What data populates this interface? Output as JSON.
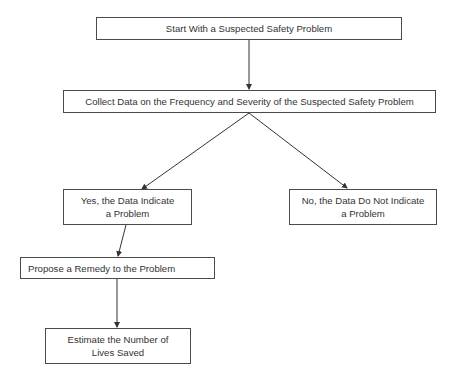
{
  "diagram": {
    "type": "flowchart",
    "nodes": [
      {
        "id": "start",
        "label": "Start With a Suspected Safety Problem"
      },
      {
        "id": "collect",
        "label": "Collect Data on the Frequency and Severity of the Suspected Safety Problem"
      },
      {
        "id": "yes",
        "label_line1": "Yes, the Data Indicate",
        "label_line2": "a Problem"
      },
      {
        "id": "no",
        "label_line1": "No, the Data Do Not Indicate",
        "label_line2": "a Problem"
      },
      {
        "id": "propose",
        "label": "Propose a Remedy to the Problem"
      },
      {
        "id": "estimate",
        "label_line1": "Estimate the Number of",
        "label_line2": "Lives Saved"
      }
    ],
    "edges": [
      {
        "from": "start",
        "to": "collect"
      },
      {
        "from": "collect",
        "to": "yes"
      },
      {
        "from": "collect",
        "to": "no"
      },
      {
        "from": "yes",
        "to": "propose"
      },
      {
        "from": "propose",
        "to": "estimate"
      }
    ],
    "colors": {
      "line": "#333333",
      "border": "#4a4a4a",
      "text": "#333333",
      "background": "#ffffff"
    }
  }
}
